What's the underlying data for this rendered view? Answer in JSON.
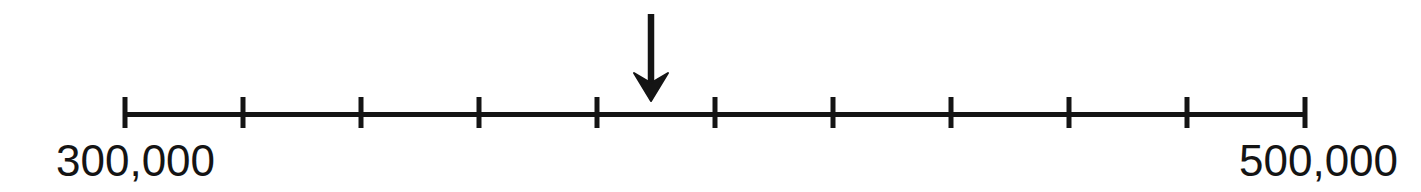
{
  "figure": {
    "title": "",
    "background_color": "#ffffff",
    "ink_color": "#141414"
  },
  "labels": {
    "left_endpoint": "300,000",
    "right_endpoint": "500,000"
  },
  "marker": {
    "icon": "down-arrow-icon",
    "points_to_value": 389000,
    "shaft_top_y": 14,
    "tip_y": 100,
    "x": 651
  },
  "chart_data": {
    "type": "line",
    "subtype": "number-line",
    "title": "",
    "xlabel": "",
    "ylabel": "",
    "xlim": [
      300000,
      500000
    ],
    "grid": false,
    "legend": null,
    "tick_count": 11,
    "tick_interval": 20000,
    "tick_values": [
      300000,
      320000,
      340000,
      360000,
      380000,
      400000,
      420000,
      440000,
      460000,
      480000,
      500000
    ],
    "tick_labels": [
      "300,000",
      "",
      "",
      "",
      "",
      "",
      "",
      "",
      "",
      "",
      "500,000"
    ],
    "tick_pixel_x": [
      125,
      243,
      361,
      479,
      597,
      715,
      833,
      951,
      1069,
      1187,
      1305
    ],
    "axis_line": {
      "x1": 125,
      "x2": 1305,
      "y": 114,
      "thickness": 5
    },
    "tick_marks": {
      "top_y": 97,
      "bottom_y": 128,
      "thickness": 5
    },
    "annotations": [
      {
        "type": "arrow",
        "direction": "down",
        "x_pixel": 651,
        "value": 389000,
        "label": ""
      }
    ]
  }
}
